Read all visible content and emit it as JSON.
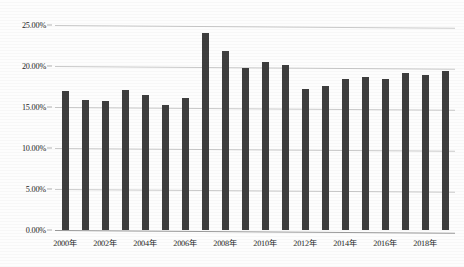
{
  "chart_data": {
    "type": "bar",
    "title": "",
    "subtitle": "",
    "xlabel": "",
    "ylabel": "",
    "categories": [
      "2000年",
      "2001年",
      "2002年",
      "2003年",
      "2004年",
      "2005年",
      "2006年",
      "2007年",
      "2008年",
      "2009年",
      "2010年",
      "2011年",
      "2012年",
      "2013年",
      "2014年",
      "2015年",
      "2016年",
      "2017年",
      "2018年",
      "2019年"
    ],
    "values": [
      17.0,
      15.8,
      15.7,
      17.1,
      16.5,
      15.3,
      16.1,
      24.0,
      21.8,
      19.8,
      20.5,
      20.1,
      17.2,
      17.6,
      18.4,
      18.6,
      18.4,
      19.1,
      18.9,
      19.4
    ],
    "series": [
      {
        "name": "",
        "values": [
          17.0,
          15.8,
          15.7,
          17.1,
          16.5,
          15.3,
          16.1,
          24.0,
          21.8,
          19.8,
          20.5,
          20.1,
          17.2,
          17.6,
          18.4,
          18.6,
          18.4,
          19.1,
          18.9,
          19.4
        ]
      }
    ],
    "ylim": [
      0,
      25
    ],
    "y_ticks": [
      0,
      5,
      10,
      15,
      20,
      25
    ],
    "y_tick_labels": [
      "0.00%",
      "5.00%",
      "10.00%",
      "15.00%",
      "20.00%",
      "25.00%"
    ],
    "x_tick_labels": [
      "2000年",
      "2002年",
      "2004年",
      "2006年",
      "2008年",
      "2010年",
      "2012年",
      "2014年",
      "2016年",
      "2018年"
    ],
    "x_tick_indices": [
      0,
      2,
      4,
      6,
      8,
      10,
      12,
      14,
      16,
      18
    ],
    "grid": true,
    "grid_axis": "y",
    "legend": false,
    "legend_position": "none",
    "bar_color": "#3e3e3e",
    "grid_color": "#c9c9c9",
    "background_color": "#fdfdfd",
    "value_unit": "%"
  }
}
